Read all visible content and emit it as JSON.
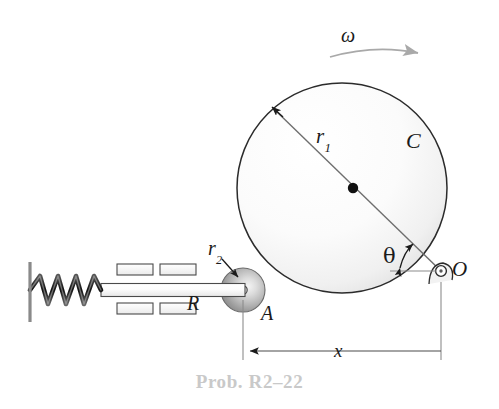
{
  "figure": {
    "caption": "Prob. R2–22",
    "background_color": "#ffffff",
    "stroke_color": "#1a1a1a",
    "caption_color": "#c9c9c9",
    "width": 499,
    "height": 409
  },
  "labels": {
    "omega": "ω",
    "r1_base": "r",
    "r1_sub": "1",
    "r2_base": "r",
    "r2_sub": "2",
    "disk_C": "C",
    "pin_O": "O",
    "roller_A": "A",
    "rod_R": "R",
    "theta": "θ",
    "distance_x": "x"
  },
  "components": {
    "wall": "fixed-wall",
    "spring": "coil-spring",
    "guides": "slider-guide-blocks",
    "rod": "horizontal-rod",
    "roller": "roller-disk-A",
    "disk": "rotating-disk-C",
    "pin": "pin-joint-O",
    "center_dot": "disk-center-point",
    "rotation_arrow": "omega-rotation-arrow",
    "angle_arc": "theta-angle-arc",
    "dimension": "x-dimension-line"
  },
  "geometry": {
    "disk_center_x": 342,
    "disk_center_y": 188,
    "disk_radius": 105,
    "roller_center_x": 243,
    "roller_center_y": 290,
    "roller_radius": 22,
    "pin_x": 441,
    "pin_y": 271
  }
}
